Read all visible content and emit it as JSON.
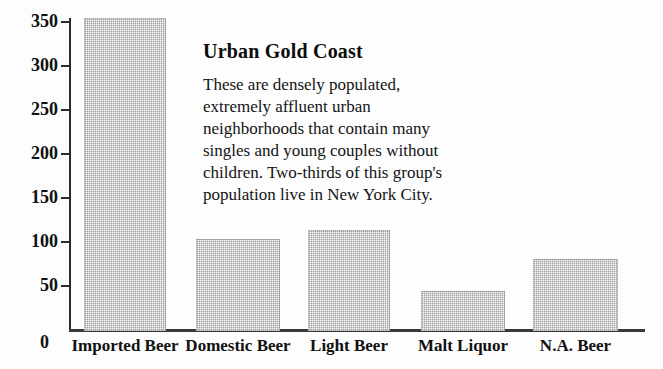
{
  "chart_data": {
    "type": "bar",
    "title": "",
    "xlabel": "",
    "ylabel": "",
    "categories": [
      "Imported Beer",
      "Domestic Beer",
      "Light Beer",
      "Malt Liquor",
      "N.A. Beer"
    ],
    "values": [
      356,
      105,
      115,
      45,
      82
    ],
    "ylim": [
      0,
      360
    ],
    "yticks": [
      0,
      50,
      100,
      150,
      200,
      250,
      300,
      350
    ],
    "ytick_labels": [
      "0",
      "50",
      "100",
      "150",
      "200",
      "250",
      "300",
      "350"
    ],
    "grid": false,
    "legend": false,
    "bar_color": "#b3b3b3",
    "axis_color": "#2b2b2b"
  },
  "annotation": {
    "title": "Urban Gold Coast",
    "lines": [
      "These are densely populated,",
      "extremely affluent urban",
      "neighborhoods that contain many",
      "singles and young couples without",
      "children.  Two-thirds of this group's",
      "population live in New York City."
    ]
  },
  "axis": {
    "zero_label": "0"
  }
}
